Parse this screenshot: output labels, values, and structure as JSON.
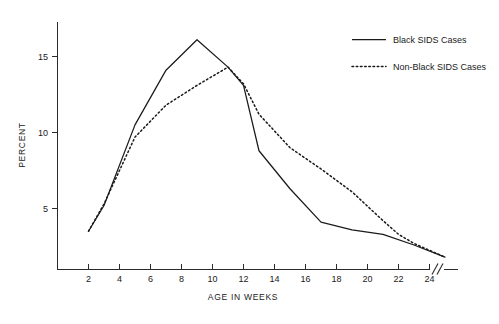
{
  "chart_data": {
    "type": "line",
    "title": "",
    "xlabel": "AGE IN WEEKS",
    "ylabel": "PERCENT",
    "xlim": [
      0,
      26
    ],
    "ylim": [
      0,
      17.5
    ],
    "grid": false,
    "legend_position": "top-right",
    "x_ticks": [
      2,
      4,
      6,
      8,
      10,
      12,
      14,
      16,
      18,
      20,
      22,
      24
    ],
    "y_ticks": [
      5,
      10,
      15
    ],
    "axis_break": {
      "present": true,
      "symbol": "//",
      "location": "x-axis-right-end",
      "after_tick": 24
    },
    "series": [
      {
        "name": "Black SIDS Cases",
        "style": "solid",
        "color": "#1a1a1a",
        "x": [
          2,
          3,
          5,
          7,
          9,
          11,
          12,
          13,
          15,
          17,
          19,
          21,
          23,
          25
        ],
        "values": [
          3.5,
          5.2,
          10.5,
          14.1,
          16.1,
          14.3,
          13.1,
          8.8,
          6.3,
          4.1,
          3.6,
          3.3,
          2.6,
          1.8
        ]
      },
      {
        "name": "Non-Black SIDS Cases",
        "style": "dotted",
        "color": "#1a1a1a",
        "x": [
          2,
          3,
          5,
          7,
          9,
          11,
          12,
          13,
          15,
          17,
          19,
          21,
          22,
          23,
          25
        ],
        "values": [
          3.5,
          5.3,
          9.7,
          11.8,
          13.1,
          14.3,
          13.2,
          11.2,
          9.0,
          7.6,
          6.1,
          4.2,
          3.3,
          2.7,
          1.8
        ]
      }
    ]
  },
  "legend": {
    "entries": [
      {
        "label": "Black SIDS Cases",
        "style": "solid"
      },
      {
        "label": "Non-Black SIDS Cases",
        "style": "dotted"
      }
    ]
  },
  "axes": {
    "x_title": "AGE IN WEEKS",
    "y_title": "PERCENT",
    "x_tick_labels": [
      "2",
      "4",
      "6",
      "8",
      "10",
      "12",
      "14",
      "16",
      "18",
      "20",
      "22",
      "24"
    ],
    "y_tick_labels": [
      "5",
      "10",
      "15"
    ]
  }
}
